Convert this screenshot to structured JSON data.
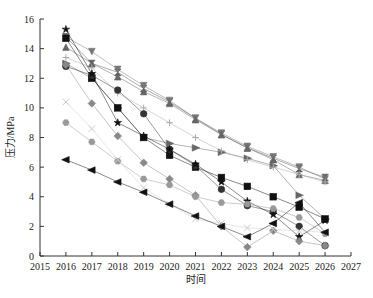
{
  "chart_data": {
    "type": "line",
    "title": "",
    "xlabel": "时间",
    "ylabel": "压力/MPa",
    "xlim": [
      2015,
      2027
    ],
    "ylim": [
      0,
      16
    ],
    "x_ticks": [
      2015,
      2016,
      2017,
      2018,
      2019,
      2020,
      2021,
      2022,
      2023,
      2024,
      2025,
      2026,
      2027
    ],
    "y_ticks": [
      0,
      2,
      4,
      6,
      8,
      10,
      12,
      14,
      16
    ],
    "grid": false,
    "legend": "none",
    "x": [
      2016,
      2017,
      2018,
      2019,
      2020,
      2021,
      2022,
      2023,
      2024,
      2025,
      2026
    ],
    "series": [
      {
        "name": "bowtie",
        "marker": "bowtie",
        "color": "#555555",
        "values": [
          14.8,
          13.0,
          12.4,
          11.3,
          10.4,
          9.3,
          8.2,
          7.3,
          6.6,
          5.9,
          5.3
        ]
      },
      {
        "name": "triangle-down",
        "marker": "triangle-down",
        "color": "#777777",
        "values": [
          14.8,
          13.8,
          12.6,
          11.5,
          10.5,
          9.3,
          8.3,
          7.4,
          6.7,
          6.0,
          5.2
        ]
      },
      {
        "name": "triangle-up",
        "marker": "triangle-up",
        "color": "#666666",
        "values": [
          14.1,
          13.0,
          12.1,
          11.1,
          10.3,
          9.2,
          8.2,
          7.3,
          6.5,
          5.5,
          5.1
        ]
      },
      {
        "name": "triangle-right",
        "marker": "triangle-right",
        "color": "#666666",
        "values": [
          13.0,
          12.0,
          10.0,
          8.0,
          7.6,
          7.3,
          7.0,
          6.6,
          6.1,
          4.1,
          2.5
        ]
      },
      {
        "name": "plus",
        "marker": "plus",
        "color": "#aaaaaa",
        "values": [
          13.4,
          12.7,
          11.0,
          10.0,
          9.0,
          8.0,
          7.1,
          6.5,
          6.0,
          5.5,
          5.0
        ]
      },
      {
        "name": "square",
        "marker": "square",
        "color": "#111111",
        "values": [
          14.7,
          12.0,
          10.0,
          8.0,
          6.8,
          6.0,
          5.3,
          4.7,
          4.0,
          3.3,
          2.5
        ]
      },
      {
        "name": "circle",
        "marker": "circle",
        "color": "#333333",
        "values": [
          12.8,
          12.2,
          11.2,
          9.6,
          7.2,
          6.1,
          4.5,
          3.4,
          3.0,
          2.0,
          0.7
        ]
      },
      {
        "name": "star",
        "marker": "star",
        "color": "#111111",
        "values": [
          15.3,
          12.3,
          9.0,
          8.1,
          7.2,
          6.2,
          5.0,
          3.7,
          2.8,
          1.3,
          2.4
        ]
      },
      {
        "name": "diamond",
        "marker": "diamond",
        "color": "#888888",
        "values": [
          12.9,
          10.3,
          8.1,
          6.3,
          5.2,
          4.1,
          2.0,
          0.6,
          1.7,
          1.0,
          0.7
        ]
      },
      {
        "name": "hexagon",
        "marker": "hexagon",
        "color": "#999999",
        "values": [
          9.0,
          7.7,
          6.4,
          5.2,
          4.8,
          4.0,
          3.6,
          3.5,
          3.2,
          2.6,
          1.5
        ]
      },
      {
        "name": "cross",
        "marker": "cross",
        "color": "#cccccc",
        "values": [
          10.4,
          8.6,
          6.5,
          4.6,
          3.5,
          2.5,
          2.2,
          1.9,
          1.8,
          1.7,
          1.6
        ]
      },
      {
        "name": "triangle-left",
        "marker": "triangle-left",
        "color": "#111111",
        "values": [
          6.5,
          5.8,
          5.0,
          4.3,
          3.5,
          2.7,
          2.0,
          1.3,
          2.2,
          3.6,
          1.6
        ]
      }
    ]
  }
}
